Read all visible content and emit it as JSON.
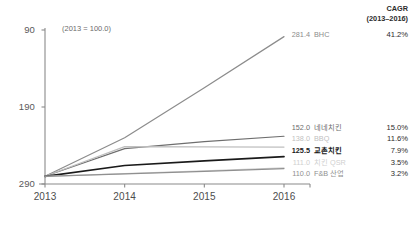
{
  "note": "(2013 = 100.0)",
  "cagr_header_line1": "CAGR",
  "cagr_header_line2": "(2013–2016)",
  "axis": {
    "y_ticks": [
      "290",
      "190",
      "90"
    ],
    "x_ticks": [
      "2013",
      "2014",
      "2015",
      "2016"
    ]
  },
  "series_labels": [
    {
      "value": "281.4",
      "name": "BHC",
      "cagr": "41.2%"
    },
    {
      "value": "152.0",
      "name": "네네치킨",
      "cagr": "15.0%"
    },
    {
      "value": "138.0",
      "name": "BBQ",
      "cagr": "11.6%"
    },
    {
      "value": "125.5",
      "name": "교촌치킨",
      "cagr": "7.9%"
    },
    {
      "value": "111.0",
      "name": "치킨 QSR",
      "cagr": "3.5%"
    },
    {
      "value": "110.0",
      "name": "F&B 산업",
      "cagr": "3.2%"
    }
  ],
  "chart_data": {
    "type": "line",
    "title": "",
    "subtitle": "(2013 = 100.0)",
    "xlabel": "",
    "ylabel": "",
    "x": [
      "2013",
      "2014",
      "2015",
      "2016"
    ],
    "ylim": [
      90,
      290
    ],
    "yticks": [
      90,
      190,
      290
    ],
    "grid": false,
    "legend": "right-endpoint-labels",
    "annotations": [
      "(2013 = 100.0)",
      "CAGR (2013–2016)"
    ],
    "series": [
      {
        "name": "BHC",
        "values": [
          100.0,
          150.0,
          215.0,
          281.4
        ],
        "cagr": "41.2%",
        "color": "#8c8c8c",
        "emphasis": false
      },
      {
        "name": "네네치킨",
        "values": [
          100.0,
          136.0,
          145.0,
          152.0
        ],
        "cagr": "15.0%",
        "color": "#6e6e6e",
        "emphasis": false
      },
      {
        "name": "BBQ",
        "values": [
          100.0,
          138.5,
          138.2,
          138.0
        ],
        "cagr": "11.6%",
        "color": "#bfbfbf",
        "emphasis": false
      },
      {
        "name": "교촌치킨",
        "values": [
          100.0,
          114.0,
          120.0,
          125.5
        ],
        "cagr": "7.9%",
        "color": "#1a1a1a",
        "emphasis": true
      },
      {
        "name": "치킨 QSR",
        "values": [
          100.0,
          103.5,
          107.0,
          111.0
        ],
        "cagr": "3.5%",
        "color": "#d0d0d0",
        "emphasis": false
      },
      {
        "name": "F&B 산업",
        "values": [
          100.0,
          103.2,
          106.5,
          110.0
        ],
        "cagr": "3.2%",
        "color": "#909090",
        "emphasis": false
      }
    ]
  },
  "colors": {
    "axis": "#8a8a8a",
    "emphasis": "#1a1a1a",
    "text": "#4d4d4d"
  }
}
